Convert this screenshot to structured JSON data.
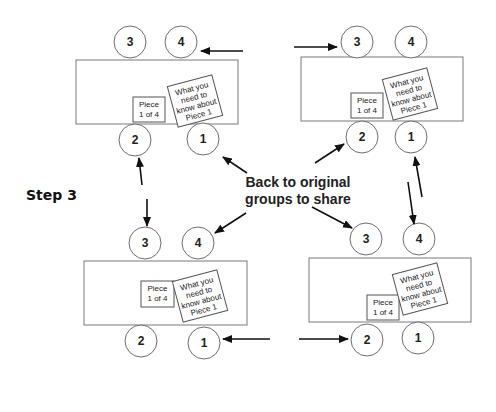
{
  "step_label": "Step 3",
  "center_label": {
    "line1": "Back to original",
    "line2": "groups to share"
  },
  "card": {
    "piece_line1": "Piece",
    "piece_line2": "1 of 4",
    "info_line1": "What you",
    "info_line2": "need to",
    "info_line3": "know about",
    "info_line4": "Piece 1"
  },
  "groups": [
    {
      "name": "top-left",
      "seats": [
        "3",
        "4",
        "2",
        "1"
      ]
    },
    {
      "name": "top-right",
      "seats": [
        "3",
        "4",
        "2",
        "1"
      ]
    },
    {
      "name": "bottom-left",
      "seats": [
        "3",
        "4",
        "2",
        "1"
      ]
    },
    {
      "name": "bottom-right",
      "seats": [
        "3",
        "4",
        "2",
        "1"
      ]
    }
  ],
  "colors": {
    "stroke": "#6e6e6e",
    "arrow": "#111111",
    "background": "#ffffff"
  }
}
